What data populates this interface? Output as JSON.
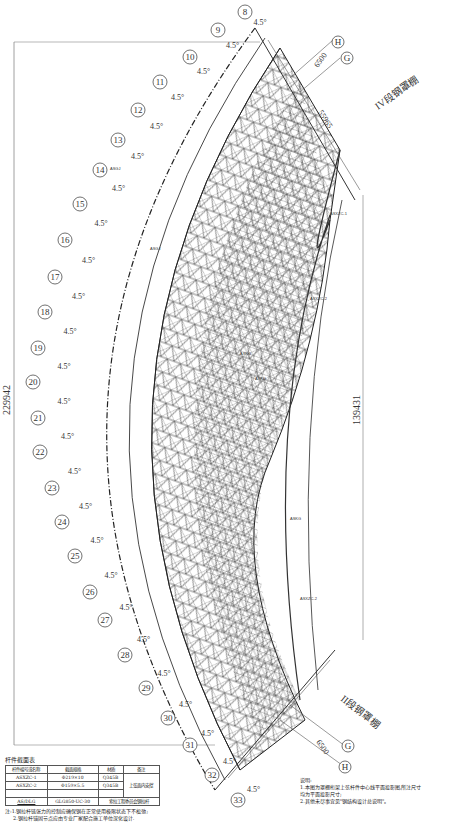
{
  "drawing": {
    "radial_axes": [
      "8",
      "9",
      "10",
      "11",
      "12",
      "13",
      "14",
      "15",
      "16",
      "17",
      "18",
      "19",
      "20",
      "21",
      "22",
      "23",
      "24",
      "25",
      "26",
      "27",
      "28",
      "29",
      "30",
      "31",
      "32",
      "33"
    ],
    "angle_step_label": "4.5°",
    "grid_axes_top": [
      "H",
      "G"
    ],
    "grid_axes_bottom": [
      "G",
      "H"
    ],
    "overall_dimension_left": "229942",
    "overall_dimension_right": "139431",
    "top_chord_dimension": "55965",
    "top_small_dimension": "6500",
    "bottom_small_dimension": "6500",
    "section_labels": {
      "upper": "IV段钢罩棚",
      "lower": "II段钢罩棚"
    },
    "member_tags": [
      "ASXZC-1",
      "ASXZC-2",
      "ASGJ",
      "ASKG"
    ]
  },
  "member_table": {
    "title": "杆件截面表",
    "headers": [
      "杆件编号或名称",
      "截面规格",
      "材质",
      "备注"
    ],
    "rows": [
      [
        "ASXZC-1",
        "Φ219×10",
        "Q345B",
        "上弦面内支撑"
      ],
      [
        "ASXZC-2",
        "Φ159×5.5",
        "Q345B",
        ""
      ],
      [
        "",
        "",
        "",
        ""
      ],
      [
        "AS/DLG",
        "GLG850-UC-30",
        "索拉工程委员会钢拉杆"
      ]
    ],
    "note_lines": [
      "注:1.钢拉杆链张力的控制应确保钢在正常使用极限状态下不松弛;",
      "2.钢拉杆锚固节点应由专业厂家配合施工单位深化设计."
    ]
  },
  "notes": {
    "title": "说明:",
    "lines": [
      "1.本图为罩棚桁架上弦杆件中心线平面投影图,所注尺寸",
      "均为平面投影尺寸;",
      "2.其他未尽事宜见\"钢结构设计总说明\"。"
    ]
  }
}
